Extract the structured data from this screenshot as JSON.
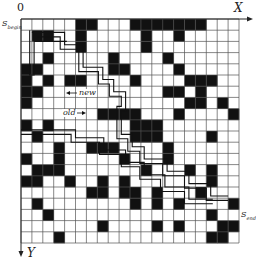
{
  "axes": {
    "origin_label": "0",
    "x_label": "X",
    "y_label": "Y"
  },
  "labels": {
    "start": "S",
    "start_sub": "begin",
    "end": "S",
    "end_sub": "end",
    "new_path": "new",
    "old_path": "old"
  },
  "grid": {
    "cols": 20,
    "rows": 20,
    "left": 21,
    "top": 19,
    "cell_w": 10.9,
    "cell_h": 11.2,
    "fill_color": "#111111",
    "line_color": "#555555",
    "obstacles": [
      [
        0,
        5
      ],
      [
        0,
        6
      ],
      [
        0,
        10
      ],
      [
        0,
        11
      ],
      [
        0,
        12
      ],
      [
        0,
        13
      ],
      [
        0,
        14
      ],
      [
        0,
        15
      ],
      [
        0,
        16
      ],
      [
        1,
        1
      ],
      [
        1,
        2
      ],
      [
        1,
        5
      ],
      [
        1,
        11
      ],
      [
        1,
        14
      ],
      [
        2,
        5
      ],
      [
        2,
        11
      ],
      [
        3,
        2
      ],
      [
        3,
        8
      ],
      [
        3,
        13
      ],
      [
        4,
        0
      ],
      [
        4,
        1
      ],
      [
        4,
        8
      ],
      [
        4,
        9
      ],
      [
        4,
        14
      ],
      [
        5,
        0
      ],
      [
        5,
        2
      ],
      [
        5,
        4
      ],
      [
        5,
        5
      ],
      [
        5,
        10
      ],
      [
        5,
        15
      ],
      [
        5,
        16
      ],
      [
        5,
        17
      ],
      [
        6,
        0
      ],
      [
        6,
        1
      ],
      [
        6,
        13
      ],
      [
        6,
        14
      ],
      [
        6,
        16
      ],
      [
        7,
        0
      ],
      [
        7,
        15
      ],
      [
        7,
        16
      ],
      [
        7,
        18
      ],
      [
        8,
        7
      ],
      [
        8,
        8
      ],
      [
        8,
        9
      ],
      [
        8,
        10
      ],
      [
        8,
        14
      ],
      [
        8,
        19
      ],
      [
        9,
        0
      ],
      [
        9,
        2
      ],
      [
        9,
        10
      ],
      [
        9,
        11
      ],
      [
        9,
        12
      ],
      [
        10,
        1
      ],
      [
        10,
        10
      ],
      [
        10,
        11
      ],
      [
        10,
        12
      ],
      [
        10,
        17
      ],
      [
        11,
        3
      ],
      [
        11,
        6
      ],
      [
        11,
        7
      ],
      [
        11,
        8
      ],
      [
        11,
        13
      ],
      [
        12,
        0
      ],
      [
        12,
        3
      ],
      [
        12,
        9
      ],
      [
        12,
        13
      ],
      [
        13,
        1
      ],
      [
        13,
        2
      ],
      [
        13,
        3
      ],
      [
        13,
        11
      ],
      [
        13,
        15
      ],
      [
        13,
        17
      ],
      [
        14,
        0
      ],
      [
        14,
        1
      ],
      [
        14,
        4
      ],
      [
        14,
        7
      ],
      [
        14,
        9
      ],
      [
        14,
        17
      ],
      [
        15,
        6
      ],
      [
        15,
        7
      ],
      [
        15,
        9
      ],
      [
        15,
        10
      ],
      [
        15,
        12
      ],
      [
        15,
        16
      ],
      [
        16,
        1
      ],
      [
        16,
        10
      ],
      [
        16,
        12
      ],
      [
        16,
        14
      ],
      [
        16,
        19
      ],
      [
        17,
        2
      ],
      [
        17,
        17
      ],
      [
        18,
        7
      ],
      [
        18,
        12
      ],
      [
        18,
        14
      ],
      [
        18,
        18
      ],
      [
        18,
        19
      ],
      [
        19,
        3
      ],
      [
        19,
        17
      ],
      [
        19,
        18
      ]
    ]
  },
  "paths": {
    "outer": [
      [
        1,
        1.2
      ],
      [
        4,
        1.2
      ],
      [
        4,
        2.3
      ],
      [
        5.7,
        2.3
      ],
      [
        5.7,
        4.3
      ],
      [
        7.5,
        4.3
      ],
      [
        7.5,
        5.4
      ],
      [
        8.5,
        5.4
      ],
      [
        8.5,
        6.5
      ],
      [
        9.6,
        6.5
      ],
      [
        9.6,
        8.2
      ],
      [
        9.2,
        8.2
      ],
      [
        9.2,
        10.3
      ],
      [
        10.2,
        10.3
      ],
      [
        10.2,
        11.4
      ],
      [
        11.3,
        11.4
      ],
      [
        11.3,
        12.5
      ],
      [
        13.4,
        12.5
      ],
      [
        13.4,
        13.6
      ],
      [
        15.4,
        13.6
      ],
      [
        15.4,
        14.7
      ],
      [
        17.4,
        14.7
      ],
      [
        17.4,
        15.8
      ],
      [
        19,
        15.8
      ]
    ],
    "inner": [
      [
        1.4,
        1.6
      ],
      [
        3.6,
        1.6
      ],
      [
        3.6,
        2.7
      ],
      [
        5.3,
        2.7
      ],
      [
        5.3,
        4.7
      ],
      [
        7.1,
        4.7
      ],
      [
        7.1,
        5.8
      ],
      [
        8.1,
        5.8
      ],
      [
        8.1,
        6.9
      ],
      [
        9.2,
        6.9
      ],
      [
        9.2,
        7.8
      ],
      [
        8.8,
        7.8
      ],
      [
        8.8,
        10.7
      ],
      [
        9.8,
        10.7
      ],
      [
        9.8,
        11.8
      ],
      [
        10.9,
        11.8
      ],
      [
        10.9,
        12.9
      ],
      [
        13,
        12.9
      ],
      [
        13,
        14
      ],
      [
        15,
        14
      ],
      [
        15,
        15.1
      ],
      [
        17,
        15.1
      ],
      [
        17,
        16.2
      ],
      [
        19,
        16.2
      ]
    ],
    "middle": [
      [
        0.8,
        1.0
      ],
      [
        0.8,
        5.0
      ],
      [
        1.2,
        5.0
      ],
      [
        1.2,
        2.0
      ],
      [
        4.2,
        2.0
      ]
    ],
    "diag_a": [
      [
        0,
        9.9
      ],
      [
        5,
        9.9
      ],
      [
        5,
        10.6
      ],
      [
        7.6,
        10.6
      ],
      [
        7.6,
        11.7
      ],
      [
        9.6,
        11.7
      ],
      [
        9.6,
        12.8
      ],
      [
        11.3,
        12.8
      ],
      [
        11.3,
        13.9
      ],
      [
        13.2,
        13.9
      ],
      [
        13.2,
        15.0
      ],
      [
        15.4,
        15.0
      ],
      [
        15.4,
        16.1
      ],
      [
        17.6,
        16.1
      ]
    ],
    "diag_b": [
      [
        0,
        10.3
      ],
      [
        4.6,
        10.3
      ],
      [
        4.6,
        11.0
      ],
      [
        7.2,
        11.0
      ],
      [
        7.2,
        12.1
      ],
      [
        9.2,
        12.1
      ],
      [
        9.2,
        13.2
      ],
      [
        10.9,
        13.2
      ],
      [
        10.9,
        14.3
      ],
      [
        12.8,
        14.3
      ],
      [
        12.8,
        15.4
      ],
      [
        15,
        15.4
      ],
      [
        15,
        16.5
      ],
      [
        17.6,
        16.5
      ]
    ]
  }
}
